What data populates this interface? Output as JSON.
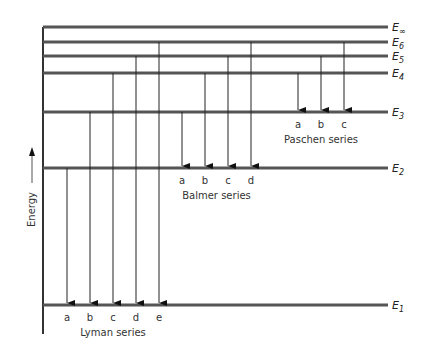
{
  "diagram": {
    "axis_label": "Energy",
    "levels": [
      {
        "name": "E∞",
        "sym": "E",
        "sub": "∞",
        "y": 27
      },
      {
        "name": "E6",
        "sym": "E",
        "sub": "6",
        "y": 42
      },
      {
        "name": "E5",
        "sym": "E",
        "sub": "5",
        "y": 56
      },
      {
        "name": "E4",
        "sym": "E",
        "sub": "4",
        "y": 73
      },
      {
        "name": "E3",
        "sym": "E",
        "sub": "3",
        "y": 112
      },
      {
        "name": "E2",
        "sym": "E",
        "sub": "2",
        "y": 168
      },
      {
        "name": "E1",
        "sym": "E",
        "sub": "1",
        "y": 305
      }
    ],
    "series": [
      {
        "name": "Lyman series",
        "final_level": "E1",
        "transitions": [
          {
            "label": "a",
            "from": "E2",
            "x": 67
          },
          {
            "label": "b",
            "from": "E3",
            "x": 90
          },
          {
            "label": "c",
            "from": "E4",
            "x": 113
          },
          {
            "label": "d",
            "from": "E5",
            "x": 136
          },
          {
            "label": "e",
            "from": "E6",
            "x": 159
          }
        ]
      },
      {
        "name": "Balmer series",
        "final_level": "E2",
        "transitions": [
          {
            "label": "a",
            "from": "E3",
            "x": 182
          },
          {
            "label": "b",
            "from": "E4",
            "x": 205
          },
          {
            "label": "c",
            "from": "E5",
            "x": 228
          },
          {
            "label": "d",
            "from": "E6",
            "x": 251
          }
        ]
      },
      {
        "name": "Paschen series",
        "final_level": "E3",
        "transitions": [
          {
            "label": "a",
            "from": "E4",
            "x": 298
          },
          {
            "label": "b",
            "from": "E5",
            "x": 321
          },
          {
            "label": "c",
            "from": "E6",
            "x": 344
          }
        ]
      }
    ]
  }
}
